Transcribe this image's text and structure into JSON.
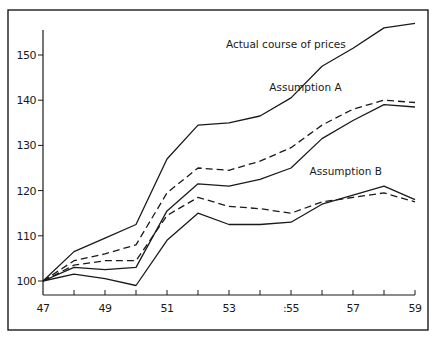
{
  "chart_data": {
    "type": "line",
    "title": "",
    "xlabel": "",
    "ylabel": "",
    "x": [
      47,
      48,
      49,
      50,
      51,
      52,
      53,
      54,
      55,
      56,
      57,
      58,
      59
    ],
    "x_tick_labels": [
      "47",
      "49",
      "51",
      "53",
      ":55",
      "57",
      "59"
    ],
    "x_tick_values": [
      47,
      49,
      51,
      53,
      55,
      57,
      59
    ],
    "y_tick_labels": [
      "100",
      "110",
      "120",
      "130",
      "140",
      "150"
    ],
    "y_tick_values": [
      100,
      110,
      120,
      130,
      140,
      150
    ],
    "xlim": [
      47,
      59
    ],
    "ylim": [
      96,
      158
    ],
    "grid": false,
    "legend": "none (inline annotations)",
    "annotations": [
      {
        "text": "Actual course of prices",
        "x": 52.9,
        "y": 151.5
      },
      {
        "text": "Assumption A",
        "x": 54.3,
        "y": 142.0
      },
      {
        "text": "Assumption B",
        "x": 55.6,
        "y": 123.5
      }
    ],
    "series": [
      {
        "name": "Actual course of prices",
        "style": "solid",
        "values": [
          100,
          106.5,
          109.5,
          112.5,
          127,
          134.5,
          135,
          136.5,
          140.5,
          147.5,
          151.5,
          156,
          157
        ]
      },
      {
        "name": "Assumption A (dashed)",
        "style": "dashed",
        "values": [
          100,
          104.5,
          106,
          108,
          119.5,
          125,
          124.5,
          126.5,
          129.5,
          134.5,
          138,
          140,
          139.5
        ]
      },
      {
        "name": "Assumption A (solid)",
        "style": "solid",
        "values": [
          100,
          103,
          102.5,
          103,
          115.5,
          121.5,
          121,
          122.5,
          125,
          131.5,
          135.5,
          139,
          138.5
        ]
      },
      {
        "name": "Assumption B (dashed)",
        "style": "dashed",
        "values": [
          100,
          103.5,
          104.5,
          104.5,
          114.5,
          118.5,
          116.5,
          116,
          115,
          117.5,
          118.5,
          119.5,
          117.5
        ]
      },
      {
        "name": "Assumption B (solid)",
        "style": "solid",
        "values": [
          100,
          101.5,
          100.5,
          99,
          109,
          115,
          112.5,
          112.5,
          113,
          117,
          119,
          121,
          118
        ]
      }
    ]
  }
}
